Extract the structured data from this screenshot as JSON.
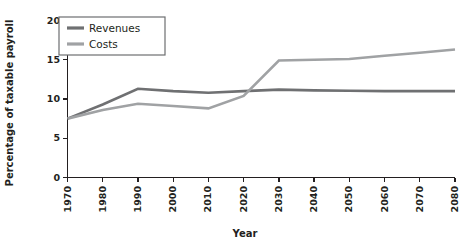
{
  "chart_data": {
    "type": "line",
    "title": "",
    "xlabel": "Year",
    "ylabel": "Percentage of taxable payroll",
    "x": [
      1970,
      1980,
      1990,
      2000,
      2010,
      2020,
      2030,
      2040,
      2050,
      2060,
      2070,
      2080
    ],
    "xlim": [
      1970,
      2080
    ],
    "ylim": [
      0,
      20
    ],
    "yticks": [
      0,
      5,
      10,
      15,
      20
    ],
    "xticks": [
      "1970",
      "1980",
      "1990",
      "2000",
      "2010",
      "2020",
      "2030",
      "2040",
      "2050",
      "2060",
      "2070",
      "2080"
    ],
    "grid": false,
    "legend_position": "top-left",
    "series": [
      {
        "name": "Revenues",
        "color": "#6f7072",
        "values": [
          7.5,
          9.3,
          11.3,
          11.0,
          10.8,
          11.0,
          11.2,
          11.1,
          11.05,
          11.0,
          11.0,
          11.0
        ]
      },
      {
        "name": "Costs",
        "color": "#a0a2a4",
        "values": [
          7.5,
          8.6,
          9.4,
          9.1,
          8.8,
          10.4,
          14.9,
          15.0,
          15.1,
          15.5,
          15.9,
          16.3
        ]
      }
    ]
  },
  "legend": {
    "entries": [
      {
        "label": "Revenues"
      },
      {
        "label": "Costs"
      }
    ]
  },
  "axes": {
    "y_title": "Percentage of taxable payroll",
    "x_title": "Year"
  }
}
